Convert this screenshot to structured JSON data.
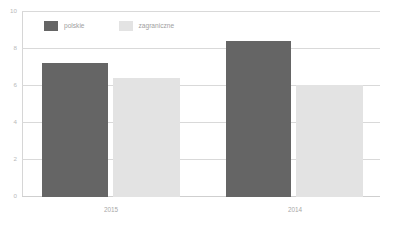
{
  "chart_data": {
    "type": "bar",
    "title": "",
    "subtitle": "",
    "xlabel": "",
    "ylabel": "",
    "ylim": [
      0,
      10
    ],
    "yticks": [
      "0",
      "2",
      "4",
      "6",
      "8",
      "10"
    ],
    "ytick_values": [
      0,
      2,
      4,
      6,
      8,
      10
    ],
    "grid": true,
    "legend_position": "top-left-inside",
    "categories": [
      "2015",
      "2014"
    ],
    "series": [
      {
        "name": "polskie",
        "color": "#656565",
        "values": [
          7.2,
          8.4
        ]
      },
      {
        "name": "zagraniczne",
        "color": "#e3e3e3",
        "values": [
          6.4,
          6.0
        ]
      }
    ]
  },
  "legend": {
    "items": [
      {
        "label": "polskie",
        "color": "#656565"
      },
      {
        "label": "zagraniczne",
        "color": "#e3e3e3"
      }
    ]
  },
  "axes": {
    "y": {
      "ticks": [
        "10",
        "8",
        "6",
        "4",
        "2",
        "0"
      ]
    },
    "x": {
      "ticks": [
        "2015",
        "2014"
      ]
    }
  },
  "caption": {
    "text": ""
  },
  "colors": {
    "series_polskie": "#656565",
    "series_zagraniczne": "#e3e3e3",
    "gridline": "#d9d9d9",
    "tick_text": "#b2b2b2",
    "background": "#ffffff"
  }
}
